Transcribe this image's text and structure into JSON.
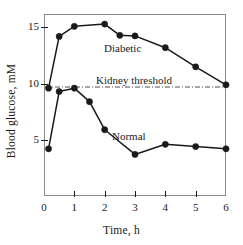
{
  "chart_data": {
    "type": "line",
    "title": "",
    "xlabel": "Time, h",
    "ylabel": "Blood glucose, mM",
    "xlim": [
      0,
      6
    ],
    "ylim": [
      0,
      16.2
    ],
    "xticks": [
      "0",
      "1",
      "2",
      "3",
      "4",
      "5",
      "6"
    ],
    "xtick_values": [
      0,
      1,
      2,
      3,
      4,
      5,
      6
    ],
    "yticks": [
      "5",
      "10",
      "15"
    ],
    "ytick_values": [
      5,
      10,
      15
    ],
    "grid": false,
    "legend": "inline-annotations",
    "marker": "filled-circle",
    "line_color": "#1a1a1a",
    "series": [
      {
        "name": "Diabetic",
        "label": "Diabetic",
        "x": [
          0.15,
          0.5,
          1.0,
          2.0,
          2.5,
          3.0,
          4.0,
          5.0,
          6.0
        ],
        "values": [
          9.6,
          14.2,
          15.1,
          15.3,
          14.3,
          14.25,
          13.2,
          11.5,
          9.9
        ]
      },
      {
        "name": "Normal",
        "label": "Normal",
        "x": [
          0.15,
          0.5,
          1.0,
          1.5,
          2.0,
          3.0,
          4.0,
          5.0,
          6.0
        ],
        "values": [
          4.2,
          9.3,
          9.6,
          8.4,
          5.9,
          3.7,
          4.6,
          4.4,
          4.2
        ]
      }
    ],
    "annotations": [
      {
        "name": "kidney-threshold",
        "text": "Kidney threshold",
        "y": 9.7,
        "style": "dash-dot horizontal line"
      },
      {
        "name": "diabetic-label",
        "text": "Diabetic"
      },
      {
        "name": "normal-label",
        "text": "Normal"
      }
    ]
  },
  "axes": {
    "x_title": "Time, h",
    "y_title": "Blood glucose, mM"
  },
  "labels": {
    "diabetic": "Diabetic",
    "normal": "Normal",
    "kidney_threshold": "Kidney threshold"
  },
  "colors": {
    "line": "#1a1a1a",
    "frame": "#8a8a8a",
    "text": "#1a1a1a",
    "background": "#ffffff"
  }
}
